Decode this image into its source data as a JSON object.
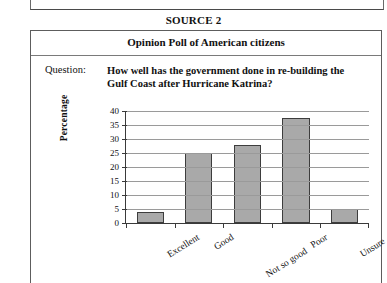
{
  "source_heading": "SOURCE 2",
  "panel": {
    "title": "Opinion Poll of American citizens",
    "question_label": "Question:",
    "question_text": "How well has the government done in re-building the Gulf Coast after Hurricane Katrina?"
  },
  "chart_data": {
    "type": "bar",
    "title": "",
    "xlabel": "",
    "ylabel": "Percentage",
    "categories": [
      "Excellent",
      "Good",
      "Not so good",
      "Poor",
      "Unsure"
    ],
    "values": [
      4,
      25,
      28,
      37.5,
      5
    ],
    "ylim": [
      0,
      40
    ],
    "yticks": [
      0,
      5,
      10,
      15,
      20,
      25,
      30,
      35,
      40
    ],
    "ytick_labels": [
      "0",
      "5",
      "10",
      "15",
      "20",
      "25",
      "30",
      "35",
      "40"
    ],
    "grid": true,
    "legend": false,
    "bar_color": "#a9a9a9",
    "bar_edge_color": "#3d3d3d",
    "axis_color": "#3a3a3a",
    "gridline_color": "#9a9a9a"
  }
}
